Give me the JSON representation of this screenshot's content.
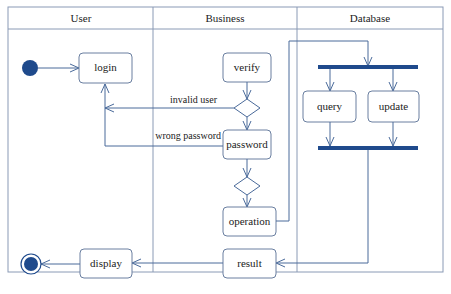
{
  "diagram": {
    "type": "UML activity diagram (swimlanes)",
    "lanes": [
      {
        "id": "user",
        "label": "User"
      },
      {
        "id": "business",
        "label": "Business"
      },
      {
        "id": "database",
        "label": "Database"
      }
    ],
    "nodes": {
      "login": "login",
      "verify": "verify",
      "password": "password",
      "operation": "operation",
      "result": "result",
      "display": "display",
      "query": "query",
      "update": "update"
    },
    "edge_labels": {
      "invalid_user": "invalid user",
      "wrong_password": "wrong password"
    },
    "colors": {
      "line": "#4a6a9a",
      "node_border": "#6a7fa0",
      "fill_dark": "#1f4a8c",
      "frame": "#8a9ab5"
    }
  }
}
